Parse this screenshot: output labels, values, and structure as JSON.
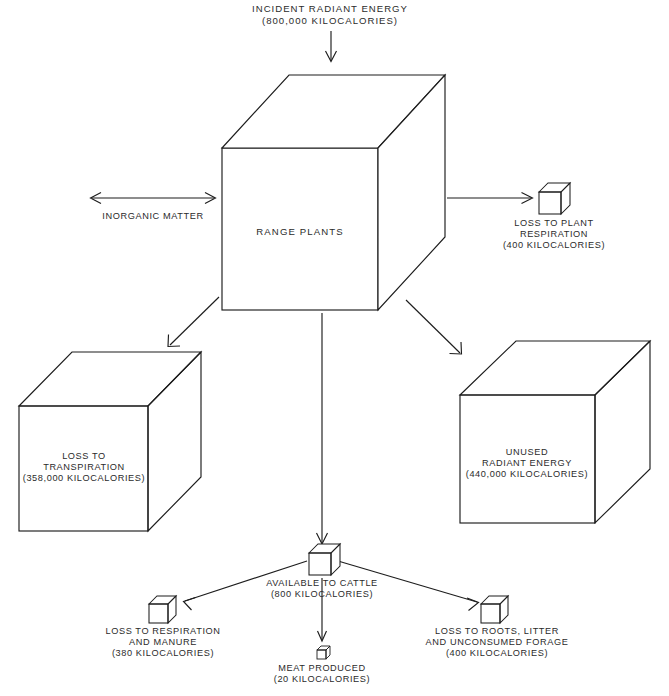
{
  "figure": {
    "type": "energy-flow-diagram",
    "units": "kilocalories"
  },
  "nodes": {
    "incident": {
      "line1": "INCIDENT RADIANT ENERGY",
      "line2": "(800,000 KILOCALORIES)",
      "value": 800000,
      "shape": "label-only"
    },
    "range_plants": {
      "line1": "RANGE PLANTS",
      "shape": "large-cube"
    },
    "inorganic": {
      "line1": "INORGANIC MATTER",
      "shape": "label-only"
    },
    "plant_respiration": {
      "line1": "LOSS TO PLANT",
      "line2": "RESPIRATION",
      "line3": "(400 KILOCALORIES)",
      "value": 400,
      "shape": "small-cube"
    },
    "transpiration": {
      "line1": "LOSS TO",
      "line2": "TRANSPIRATION",
      "line3": "(358,000 KILOCALORIES)",
      "value": 358000,
      "shape": "large-cube"
    },
    "unused": {
      "line1": "UNUSED",
      "line2": "RADIANT ENERGY",
      "line3": "(440,000 KILOCALORIES)",
      "value": 440000,
      "shape": "large-cube"
    },
    "available_cattle": {
      "line1": "AVAILABLE TO CATTLE",
      "line2": "(800 KILOCALORIES)",
      "value": 800,
      "shape": "small-cube"
    },
    "respiration_manure": {
      "line1": "LOSS TO RESPIRATION",
      "line2": "AND MANURE",
      "line3": "(380 KILOCALORIES)",
      "value": 380,
      "shape": "small-cube"
    },
    "meat": {
      "line1": "MEAT PRODUCED",
      "line2": "(20 KILOCALORIES)",
      "value": 20,
      "shape": "tiny-cube"
    },
    "roots_litter": {
      "line1": "LOSS TO ROOTS, LITTER",
      "line2": "AND UNCONSUMED FORAGE",
      "line3": "(400 KILOCALORIES)",
      "value": 400,
      "shape": "small-cube"
    }
  },
  "flows": [
    {
      "from": "incident",
      "to": "range_plants",
      "direction": "down",
      "arrow": "single"
    },
    {
      "from": "inorganic",
      "to": "range_plants",
      "direction": "horizontal",
      "arrow": "double"
    },
    {
      "from": "range_plants",
      "to": "plant_respiration",
      "direction": "right",
      "arrow": "single"
    },
    {
      "from": "range_plants",
      "to": "transpiration",
      "direction": "down-left",
      "arrow": "single"
    },
    {
      "from": "range_plants",
      "to": "unused",
      "direction": "down-right",
      "arrow": "single"
    },
    {
      "from": "range_plants",
      "to": "available_cattle",
      "direction": "down",
      "arrow": "single"
    },
    {
      "from": "available_cattle",
      "to": "respiration_manure",
      "direction": "down-left",
      "arrow": "single"
    },
    {
      "from": "available_cattle",
      "to": "meat",
      "direction": "down",
      "arrow": "single"
    },
    {
      "from": "available_cattle",
      "to": "roots_litter",
      "direction": "down-right",
      "arrow": "single"
    }
  ],
  "caption": {
    "text": ""
  }
}
